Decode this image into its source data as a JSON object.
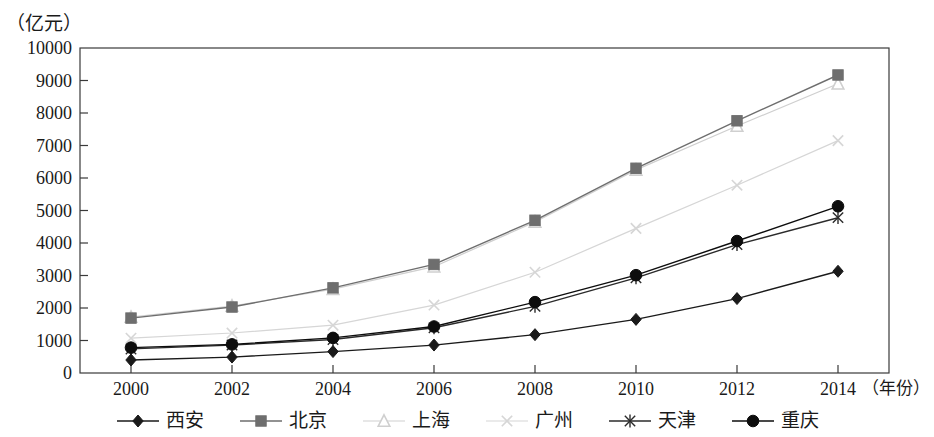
{
  "chart_data": {
    "type": "line",
    "title": "",
    "subtitle": "",
    "ylabel": "（亿元）",
    "xlabel": "（年份）",
    "categories": [
      "2000",
      "2002",
      "2004",
      "2006",
      "2008",
      "2010",
      "2012",
      "2014"
    ],
    "x": [
      2000,
      2002,
      2004,
      2006,
      2008,
      2010,
      2012,
      2014
    ],
    "ylim": [
      0,
      10000
    ],
    "ytick_labels": [
      "0",
      "1000",
      "2000",
      "3000",
      "4000",
      "5000",
      "6000",
      "7000",
      "8000",
      "9000",
      "10000"
    ],
    "ytick_values": [
      0,
      1000,
      2000,
      3000,
      4000,
      5000,
      6000,
      7000,
      8000,
      9000,
      10000
    ],
    "grid": false,
    "legend_position": "bottom",
    "series": [
      {
        "name": "西安",
        "marker": "diamond",
        "color": "#1a1a1a",
        "values": [
          400,
          490,
          660,
          860,
          1180,
          1650,
          2290,
          3130
        ]
      },
      {
        "name": "北京",
        "marker": "square",
        "color": "#6e6e6e",
        "values": [
          1690,
          2030,
          2620,
          3340,
          4700,
          6300,
          7760,
          9170
        ]
      },
      {
        "name": "上海",
        "marker": "triangle",
        "color": "#cfcfcf",
        "values": [
          1720,
          2060,
          2580,
          3270,
          4650,
          6250,
          7600,
          8900
        ]
      },
      {
        "name": "广州",
        "marker": "cross",
        "color": "#d6d6d6",
        "values": [
          1070,
          1230,
          1470,
          2090,
          3100,
          4450,
          5780,
          7150
        ]
      },
      {
        "name": "天津",
        "marker": "star",
        "color": "#2b2b2b",
        "values": [
          740,
          860,
          1030,
          1390,
          2050,
          2930,
          3950,
          4780
        ]
      },
      {
        "name": "重庆",
        "marker": "circle",
        "color": "#0d0d0d",
        "values": [
          780,
          880,
          1080,
          1430,
          2180,
          3010,
          4060,
          5130
        ]
      }
    ]
  },
  "legend": {
    "items": [
      {
        "label": "西安",
        "marker": "diamond-marker",
        "color": "#1a1a1a"
      },
      {
        "label": "北京",
        "marker": "square-marker",
        "color": "#6e6e6e"
      },
      {
        "label": "上海",
        "marker": "triangle-marker",
        "color": "#cfcfcf"
      },
      {
        "label": "广州",
        "marker": "cross-marker",
        "color": "#d6d6d6"
      },
      {
        "label": "天津",
        "marker": "star-marker",
        "color": "#2b2b2b"
      },
      {
        "label": "重庆",
        "marker": "circle-marker",
        "color": "#0d0d0d"
      }
    ]
  },
  "axes": {
    "y_unit": "（亿元）",
    "x_unit": "（年份）"
  }
}
